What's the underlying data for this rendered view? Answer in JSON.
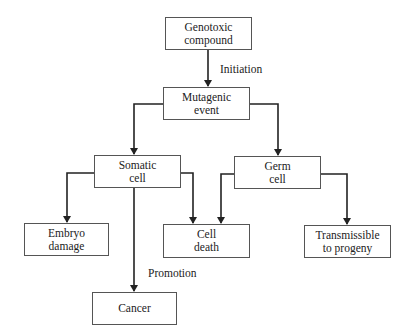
{
  "diagram": {
    "type": "flowchart",
    "nodes": [
      {
        "id": "genotoxic",
        "line1": "Genotoxic",
        "line2": "compound"
      },
      {
        "id": "mutagenic",
        "line1": "Mutagenic",
        "line2": "event"
      },
      {
        "id": "somatic",
        "line1": "Somatic",
        "line2": "cell"
      },
      {
        "id": "germ",
        "line1": "Germ",
        "line2": "cell"
      },
      {
        "id": "embryo",
        "line1": "Embryo",
        "line2": "damage"
      },
      {
        "id": "celldeath",
        "line1": "Cell",
        "line2": "death"
      },
      {
        "id": "transmissible",
        "line1": "Transmissible",
        "line2": "to progeny"
      },
      {
        "id": "cancer",
        "line1": "Cancer",
        "line2": ""
      }
    ],
    "edges": [
      {
        "from": "genotoxic",
        "to": "mutagenic",
        "label": "Initiation"
      },
      {
        "from": "mutagenic",
        "to": "somatic",
        "label": ""
      },
      {
        "from": "mutagenic",
        "to": "germ",
        "label": ""
      },
      {
        "from": "somatic",
        "to": "embryo",
        "label": ""
      },
      {
        "from": "somatic",
        "to": "celldeath",
        "label": ""
      },
      {
        "from": "somatic",
        "to": "cancer",
        "label": "Promotion"
      },
      {
        "from": "germ",
        "to": "celldeath",
        "label": ""
      },
      {
        "from": "germ",
        "to": "transmissible",
        "label": ""
      }
    ],
    "labels": {
      "initiation": "Initiation",
      "promotion": "Promotion"
    }
  }
}
